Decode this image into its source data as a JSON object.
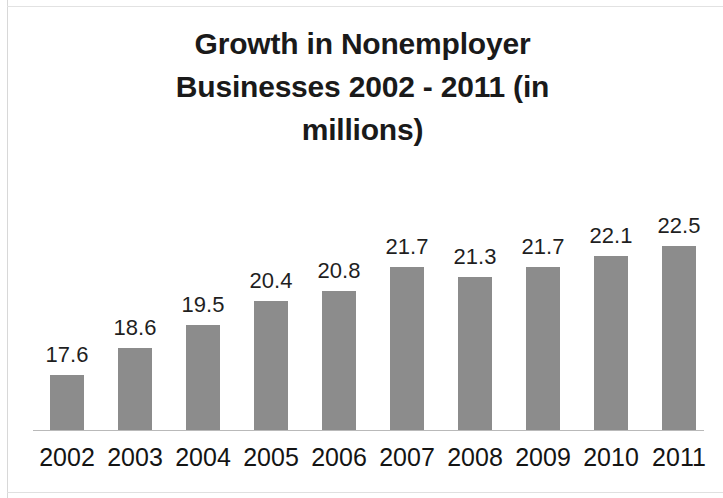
{
  "chart_data": {
    "type": "bar",
    "title": "Growth in Nonemployer Businesses 2002 - 2011 (in millions)",
    "title_lines": [
      "Growth in Nonemployer",
      "Businesses 2002 - 2011 (in",
      "millions)"
    ],
    "categories": [
      "2002",
      "2003",
      "2004",
      "2005",
      "2006",
      "2007",
      "2008",
      "2009",
      "2010",
      "2011"
    ],
    "values": [
      17.6,
      18.6,
      19.5,
      20.4,
      20.8,
      21.7,
      21.3,
      21.7,
      22.1,
      22.5
    ],
    "value_labels": [
      "17.6",
      "18.6",
      "19.5",
      "20.4",
      "20.8",
      "21.7",
      "21.3",
      "21.7",
      "22.1",
      "22.5"
    ],
    "xlabel": "",
    "ylabel": "",
    "ylim": [
      15.5,
      23.1
    ],
    "grid": false,
    "legend": false,
    "axis_visible": "x-baseline-only",
    "data_labels_shown": true,
    "bar_color": "#8c8c8c",
    "text_color": "#1a1a1a",
    "background_color": "#ffffff"
  }
}
